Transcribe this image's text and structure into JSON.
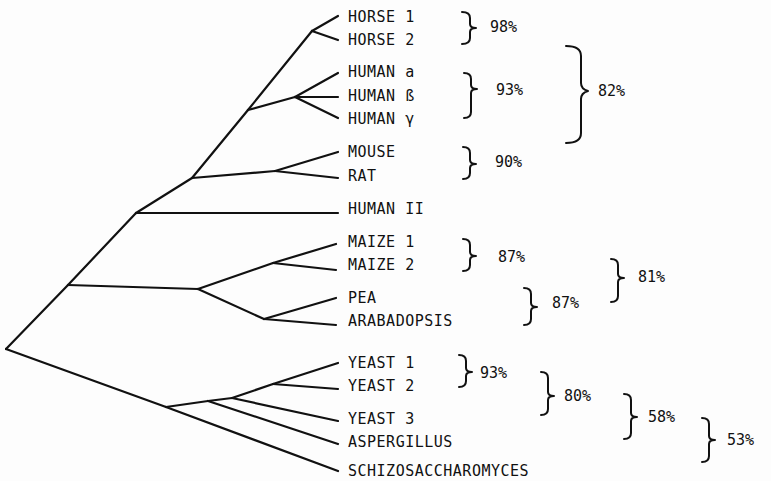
{
  "figure": {
    "type": "phylogenetic-tree",
    "line_color": "#111111",
    "background": "#fdfdfd"
  },
  "taxa": [
    {
      "label": "HORSE 1",
      "x": 348,
      "y": 17
    },
    {
      "label": "HORSE 2",
      "x": 348,
      "y": 40
    },
    {
      "label": "HUMAN a",
      "x": 348,
      "y": 72
    },
    {
      "label": "HUMAN ß",
      "x": 348,
      "y": 96
    },
    {
      "label": "HUMAN γ",
      "x": 348,
      "y": 119
    },
    {
      "label": "MOUSE",
      "x": 348,
      "y": 152
    },
    {
      "label": "RAT",
      "x": 348,
      "y": 176
    },
    {
      "label": "HUMAN II",
      "x": 348,
      "y": 209
    },
    {
      "label": "MAIZE 1",
      "x": 348,
      "y": 241
    },
    {
      "label": "MAIZE 2",
      "x": 348,
      "y": 264
    },
    {
      "label": "PEA",
      "x": 348,
      "y": 297
    },
    {
      "label": "ARABADOPSIS",
      "x": 348,
      "y": 320
    },
    {
      "label": "YEAST 1",
      "x": 348,
      "y": 360
    },
    {
      "label": "YEAST 2",
      "x": 348,
      "y": 383
    },
    {
      "label": "YEAST 3",
      "x": 348,
      "y": 413
    },
    {
      "label": "ASPERGILLUS",
      "x": 348,
      "y": 436
    },
    {
      "label": "SCHIZOSACCHAROMYCES",
      "x": 348,
      "y": 465
    }
  ],
  "identity_groups": [
    {
      "members": [
        "HORSE 1",
        "HORSE 2"
      ],
      "value": "98%"
    },
    {
      "members": [
        "HUMAN a",
        "HUMAN ß",
        "HUMAN γ"
      ],
      "value": "93%"
    },
    {
      "members": [
        "HORSE",
        "HUMAN a/ß/γ"
      ],
      "value": "82%"
    },
    {
      "members": [
        "MOUSE",
        "RAT"
      ],
      "value": "90%"
    },
    {
      "members": [
        "MAIZE 1",
        "MAIZE 2"
      ],
      "value": "87%"
    },
    {
      "members": [
        "PEA",
        "ARABADOPSIS"
      ],
      "value": "87%"
    },
    {
      "members": [
        "MAIZE",
        "PEA",
        "ARABADOPSIS"
      ],
      "value": "81%"
    },
    {
      "members": [
        "YEAST 1",
        "YEAST 2"
      ],
      "value": "93%"
    },
    {
      "members": [
        "YEAST 1",
        "YEAST 2",
        "YEAST 3"
      ],
      "value": "80%"
    },
    {
      "members": [
        "YEASTS",
        "ASPERGILLUS"
      ],
      "value": "58%"
    },
    {
      "members": [
        "YEASTS",
        "ASPERGILLUS",
        "SCHIZOSACCHAROMYCES"
      ],
      "value": "53%"
    }
  ],
  "percent_labels": [
    {
      "text": "98%",
      "x": 490,
      "y": 17
    },
    {
      "text": "93%",
      "x": 496,
      "y": 81
    },
    {
      "text": "82%",
      "x": 598,
      "y": 81
    },
    {
      "text": "90%",
      "x": 495,
      "y": 153
    },
    {
      "text": "87%",
      "x": 498,
      "y": 248
    },
    {
      "text": "81%",
      "x": 638,
      "y": 268
    },
    {
      "text": "87%",
      "x": 552,
      "y": 293
    },
    {
      "text": "93%",
      "x": 480,
      "y": 363
    },
    {
      "text": "80%",
      "x": 564,
      "y": 386
    },
    {
      "text": "58%",
      "x": 648,
      "y": 407
    },
    {
      "text": "53%",
      "x": 727,
      "y": 430
    }
  ]
}
